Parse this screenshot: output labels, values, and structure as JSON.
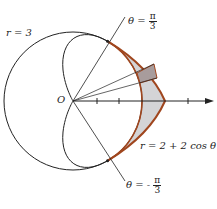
{
  "diagram": {
    "labels": {
      "circle": "r = 3",
      "cardioid": "r = 2 + 2 cos θ",
      "origin": "O",
      "ray_top_prefix": "θ =",
      "ray_top_num": "π",
      "ray_top_den": "3",
      "ray_bottom_prefix": "θ = -",
      "ray_bottom_num": "π",
      "ray_bottom_den": "3"
    },
    "colors": {
      "curve": "#222222",
      "boundary": "#a0461e",
      "shade": "#d4d4d6",
      "sector": "#a89c9c"
    }
  }
}
